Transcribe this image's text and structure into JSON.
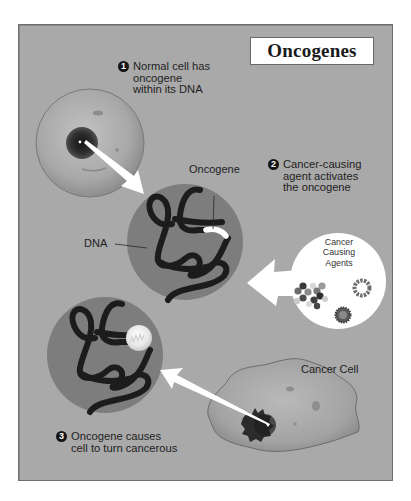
{
  "title": "Oncogenes",
  "steps": [
    {
      "number": "1",
      "lines": [
        "Normal cell has",
        "oncogene",
        "within its DNA"
      ]
    },
    {
      "number": "2",
      "lines": [
        "Cancer-causing",
        "agent activates",
        "the oncogene"
      ]
    },
    {
      "number": "3",
      "lines": [
        "Oncogene causes",
        "cell to turn cancerous"
      ]
    }
  ],
  "labels": {
    "oncogene": "Oncogene",
    "dna": "DNA",
    "agents": [
      "Cancer",
      "Causing",
      "Agents"
    ],
    "cancer_cell": "Cancer Cell"
  },
  "colors": {
    "background": "#a9a9a9",
    "frame_border": "#6e6e6e",
    "dna_circle": "#7d7d7d",
    "dna_strand": "#1c1c1c",
    "arrow": "#ffffff",
    "bubble": "#ffffff"
  }
}
